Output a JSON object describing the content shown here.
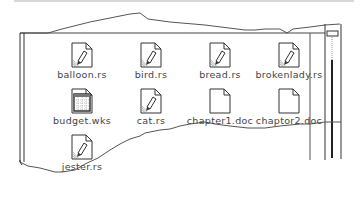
{
  "window": {
    "files": [
      {
        "name": "balloon.rs",
        "icon": "paint-doc-icon"
      },
      {
        "name": "bird.rs",
        "icon": "paint-doc-icon"
      },
      {
        "name": "bread.rs",
        "icon": "paint-doc-icon"
      },
      {
        "name": "brokenlady.rs",
        "icon": "paint-doc-icon"
      },
      {
        "name": "budget.wks",
        "icon": "spreadsheet-doc-icon"
      },
      {
        "name": "cat.rs",
        "icon": "paint-doc-icon"
      },
      {
        "name": "chapter1.doc",
        "icon": "blank-doc-icon"
      },
      {
        "name": "chaptor2.doc",
        "icon": "blank-doc-icon"
      },
      {
        "name": "jester.rs",
        "icon": "paint-doc-icon"
      }
    ]
  },
  "colors": {
    "line": "#555555",
    "frame": "#333333",
    "text": "#444444"
  }
}
